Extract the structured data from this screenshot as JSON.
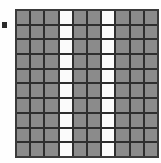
{
  "figure": {
    "title": "",
    "margin_mark": {
      "name": "left-margin-bullet",
      "color": "#2b2b2b"
    },
    "colors": {
      "filled_cell": "#8b8b8b",
      "empty_cell": "#fbfbfb",
      "grid_line": "#2e2e2e",
      "frame": "#3a3a3a",
      "background": "#fefefe"
    }
  },
  "chart_data": {
    "type": "heatmap",
    "title": "",
    "xlabel": "",
    "ylabel": "",
    "columns": 10,
    "rows": 10,
    "legend": [
      {
        "label": "filled",
        "value": 1,
        "color": "#8b8b8b"
      },
      {
        "label": "empty",
        "value": 0,
        "color": "#fbfbfb"
      }
    ],
    "empty_columns": [
      4,
      7
    ],
    "grid": [
      [
        1,
        1,
        1,
        0,
        1,
        1,
        0,
        1,
        1,
        1
      ],
      [
        1,
        1,
        1,
        0,
        1,
        1,
        0,
        1,
        1,
        1
      ],
      [
        1,
        1,
        1,
        0,
        1,
        1,
        0,
        1,
        1,
        1
      ],
      [
        1,
        1,
        1,
        0,
        1,
        1,
        0,
        1,
        1,
        1
      ],
      [
        1,
        1,
        1,
        0,
        1,
        1,
        0,
        1,
        1,
        1
      ],
      [
        1,
        1,
        1,
        0,
        1,
        1,
        0,
        1,
        1,
        1
      ],
      [
        1,
        1,
        1,
        0,
        1,
        1,
        0,
        1,
        1,
        1
      ],
      [
        1,
        1,
        1,
        0,
        1,
        1,
        0,
        1,
        1,
        1
      ],
      [
        1,
        1,
        1,
        0,
        1,
        1,
        0,
        1,
        1,
        1
      ],
      [
        1,
        1,
        1,
        0,
        1,
        1,
        0,
        1,
        1,
        1
      ]
    ]
  }
}
